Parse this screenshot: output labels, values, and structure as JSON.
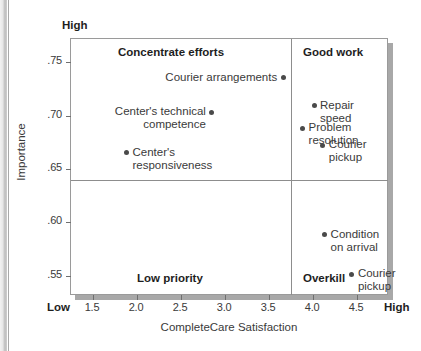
{
  "chart_data": {
    "type": "scatter",
    "title": "",
    "xlabel": "CompleteCare Satisfaction",
    "ylabel": "Importance",
    "xlim": [
      1.25,
      4.85
    ],
    "ylim": [
      0.532,
      0.772
    ],
    "grid": false,
    "legend": "none",
    "x_endpoint_low": "Low",
    "x_endpoint_high": "High",
    "y_endpoint_high": "High",
    "x_ticks": [
      "1.5",
      "2.0",
      "2.5",
      "3.0",
      "3.5",
      "4.0",
      "4.5"
    ],
    "x_tick_values": [
      1.5,
      2.0,
      2.5,
      3.0,
      3.5,
      4.0,
      4.5
    ],
    "y_ticks": [
      ".75",
      ".70",
      ".65",
      ".60",
      ".55"
    ],
    "y_tick_values": [
      0.75,
      0.7,
      0.65,
      0.6,
      0.55
    ],
    "quadrant_divider_x": 3.75,
    "quadrant_divider_y": 0.64,
    "quadrants": [
      {
        "key": "concentrate",
        "label": "Concentrate efforts"
      },
      {
        "key": "goodwork",
        "label": "Good work"
      },
      {
        "key": "lowpriority",
        "label": "Low priority"
      },
      {
        "key": "overkill",
        "label": "Overkill"
      }
    ],
    "points": [
      {
        "label": "Courier arrangements",
        "x": 3.66,
        "y": 0.7355,
        "label_side": "left",
        "quadrant": "concentrate"
      },
      {
        "label": "Center's technical\ncompetence",
        "x": 2.85,
        "y": 0.7035,
        "label_side": "left",
        "quadrant": "concentrate"
      },
      {
        "label": "Center's\nresponsiveness",
        "x": 1.88,
        "y": 0.6655,
        "label_side": "right",
        "quadrant": "concentrate"
      },
      {
        "label": "Repair speed",
        "x": 4.01,
        "y": 0.7095,
        "label_side": "right",
        "quadrant": "goodwork"
      },
      {
        "label": "Problem\nresolution",
        "x": 3.88,
        "y": 0.6885,
        "label_side": "right",
        "quadrant": "goodwork"
      },
      {
        "label": "Courier\npickup",
        "x": 4.11,
        "y": 0.6725,
        "label_side": "right",
        "quadrant": "goodwork"
      },
      {
        "label": "Condition\non arrival",
        "x": 4.13,
        "y": 0.5885,
        "label_side": "right",
        "quadrant": "overkill"
      },
      {
        "label": "Courier\npickup",
        "x": 4.44,
        "y": 0.5515,
        "label_side": "right",
        "quadrant": "overkill"
      }
    ]
  },
  "colors": {
    "point": "#4a4a4a",
    "frame": "#9a9a9a",
    "divider": "#8d8d8d",
    "text": "#3a3a3a",
    "shadow": "#a8a8a8",
    "background": "#ffffff"
  }
}
